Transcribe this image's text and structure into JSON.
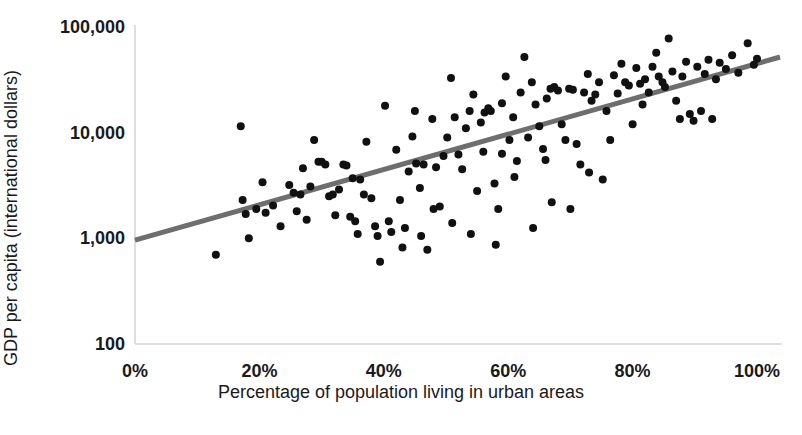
{
  "chart_data": {
    "type": "scatter",
    "title": "",
    "xlabel": "Percentage of population living in urban areas",
    "ylabel": "GDP per capita (international dollars)",
    "xlim": [
      0,
      100
    ],
    "ylim": [
      100,
      100000
    ],
    "yscale": "log",
    "xscale": "linear",
    "grid": false,
    "legend": "none",
    "xticklabels": [
      "0%",
      "20%",
      "40%",
      "60%",
      "80%",
      "100%"
    ],
    "xticks": [
      0,
      20,
      40,
      60,
      80,
      100
    ],
    "yticklabels": [
      "100",
      "1,000",
      "10,000",
      "100,000"
    ],
    "yticks": [
      100,
      1000,
      10000,
      100000
    ],
    "marker_color": "#111111",
    "marker_size_px": 8,
    "trendline": {
      "color": "#6e6e6e",
      "width_px": 5,
      "x_start": 0,
      "y_start": 960,
      "x_end": 103.7,
      "y_end": 52000
    },
    "axis_color": "#d4d4d4",
    "points": [
      {
        "x": 13.0,
        "y": 700
      },
      {
        "x": 17.0,
        "y": 11500
      },
      {
        "x": 17.3,
        "y": 2300
      },
      {
        "x": 17.8,
        "y": 1700
      },
      {
        "x": 18.3,
        "y": 1000
      },
      {
        "x": 19.5,
        "y": 1900
      },
      {
        "x": 21.0,
        "y": 1750
      },
      {
        "x": 22.2,
        "y": 2050
      },
      {
        "x": 23.4,
        "y": 1300
      },
      {
        "x": 24.8,
        "y": 3200
      },
      {
        "x": 25.5,
        "y": 2700
      },
      {
        "x": 26.0,
        "y": 1800
      },
      {
        "x": 26.6,
        "y": 2600
      },
      {
        "x": 27.0,
        "y": 4600
      },
      {
        "x": 27.6,
        "y": 1500
      },
      {
        "x": 28.2,
        "y": 3100
      },
      {
        "x": 28.8,
        "y": 8500
      },
      {
        "x": 29.5,
        "y": 5300
      },
      {
        "x": 30.0,
        "y": 5300
      },
      {
        "x": 30.6,
        "y": 5000
      },
      {
        "x": 31.2,
        "y": 2500
      },
      {
        "x": 31.8,
        "y": 2600
      },
      {
        "x": 32.2,
        "y": 1650
      },
      {
        "x": 32.8,
        "y": 2900
      },
      {
        "x": 33.5,
        "y": 5000
      },
      {
        "x": 34.0,
        "y": 4900
      },
      {
        "x": 34.6,
        "y": 1600
      },
      {
        "x": 35.0,
        "y": 3700
      },
      {
        "x": 35.4,
        "y": 1450
      },
      {
        "x": 35.8,
        "y": 1100
      },
      {
        "x": 36.2,
        "y": 3600
      },
      {
        "x": 36.8,
        "y": 2600
      },
      {
        "x": 37.2,
        "y": 8200
      },
      {
        "x": 38.0,
        "y": 2400
      },
      {
        "x": 38.6,
        "y": 1300
      },
      {
        "x": 39.4,
        "y": 600
      },
      {
        "x": 40.2,
        "y": 18000
      },
      {
        "x": 40.8,
        "y": 1450
      },
      {
        "x": 41.2,
        "y": 1150
      },
      {
        "x": 42.0,
        "y": 6900
      },
      {
        "x": 42.6,
        "y": 2300
      },
      {
        "x": 43.4,
        "y": 1250
      },
      {
        "x": 44.0,
        "y": 4300
      },
      {
        "x": 44.6,
        "y": 9200
      },
      {
        "x": 45.2,
        "y": 5100
      },
      {
        "x": 45.8,
        "y": 3000
      },
      {
        "x": 46.4,
        "y": 5000
      },
      {
        "x": 47.0,
        "y": 780
      },
      {
        "x": 47.8,
        "y": 13500
      },
      {
        "x": 48.4,
        "y": 4700
      },
      {
        "x": 49.0,
        "y": 2000
      },
      {
        "x": 49.6,
        "y": 6000
      },
      {
        "x": 50.2,
        "y": 9000
      },
      {
        "x": 50.8,
        "y": 33000
      },
      {
        "x": 51.4,
        "y": 14000
      },
      {
        "x": 52.0,
        "y": 6200
      },
      {
        "x": 52.6,
        "y": 4500
      },
      {
        "x": 53.2,
        "y": 11000
      },
      {
        "x": 53.8,
        "y": 16000
      },
      {
        "x": 54.4,
        "y": 23000
      },
      {
        "x": 55.0,
        "y": 2800
      },
      {
        "x": 55.6,
        "y": 12500
      },
      {
        "x": 56.2,
        "y": 15500
      },
      {
        "x": 56.8,
        "y": 17000
      },
      {
        "x": 57.2,
        "y": 16000
      },
      {
        "x": 57.8,
        "y": 3300
      },
      {
        "x": 58.4,
        "y": 1900
      },
      {
        "x": 59.0,
        "y": 19000
      },
      {
        "x": 59.6,
        "y": 34000
      },
      {
        "x": 60.2,
        "y": 8500
      },
      {
        "x": 60.8,
        "y": 14000
      },
      {
        "x": 61.4,
        "y": 5400
      },
      {
        "x": 62.0,
        "y": 24000
      },
      {
        "x": 62.6,
        "y": 52000
      },
      {
        "x": 63.2,
        "y": 9000
      },
      {
        "x": 63.8,
        "y": 30000
      },
      {
        "x": 64.4,
        "y": 18500
      },
      {
        "x": 65.0,
        "y": 11500
      },
      {
        "x": 65.6,
        "y": 7000
      },
      {
        "x": 66.2,
        "y": 21000
      },
      {
        "x": 66.8,
        "y": 26000
      },
      {
        "x": 67.4,
        "y": 27000
      },
      {
        "x": 68.0,
        "y": 25000
      },
      {
        "x": 68.6,
        "y": 12000
      },
      {
        "x": 69.2,
        "y": 8500
      },
      {
        "x": 69.8,
        "y": 26000
      },
      {
        "x": 70.4,
        "y": 25500
      },
      {
        "x": 71.0,
        "y": 7800
      },
      {
        "x": 71.6,
        "y": 5000
      },
      {
        "x": 72.2,
        "y": 24000
      },
      {
        "x": 72.8,
        "y": 36000
      },
      {
        "x": 73.4,
        "y": 20000
      },
      {
        "x": 74.0,
        "y": 23000
      },
      {
        "x": 74.6,
        "y": 30000
      },
      {
        "x": 75.2,
        "y": 3600
      },
      {
        "x": 75.8,
        "y": 16000
      },
      {
        "x": 76.4,
        "y": 8500
      },
      {
        "x": 77.0,
        "y": 35000
      },
      {
        "x": 77.6,
        "y": 23500
      },
      {
        "x": 78.2,
        "y": 45000
      },
      {
        "x": 78.8,
        "y": 30000
      },
      {
        "x": 79.4,
        "y": 28000
      },
      {
        "x": 80.0,
        "y": 12000
      },
      {
        "x": 80.6,
        "y": 41000
      },
      {
        "x": 81.2,
        "y": 29000
      },
      {
        "x": 81.6,
        "y": 18500
      },
      {
        "x": 82.0,
        "y": 32000
      },
      {
        "x": 82.6,
        "y": 24000
      },
      {
        "x": 83.2,
        "y": 42000
      },
      {
        "x": 83.8,
        "y": 57000
      },
      {
        "x": 84.2,
        "y": 34000
      },
      {
        "x": 84.8,
        "y": 30000
      },
      {
        "x": 85.2,
        "y": 27000
      },
      {
        "x": 85.8,
        "y": 78000
      },
      {
        "x": 86.4,
        "y": 38000
      },
      {
        "x": 87.0,
        "y": 20000
      },
      {
        "x": 87.6,
        "y": 13500
      },
      {
        "x": 88.0,
        "y": 34000
      },
      {
        "x": 88.6,
        "y": 47000
      },
      {
        "x": 89.2,
        "y": 15000
      },
      {
        "x": 89.8,
        "y": 13000
      },
      {
        "x": 90.4,
        "y": 42000
      },
      {
        "x": 91.0,
        "y": 16000
      },
      {
        "x": 91.6,
        "y": 36000
      },
      {
        "x": 92.2,
        "y": 49000
      },
      {
        "x": 92.8,
        "y": 13500
      },
      {
        "x": 93.4,
        "y": 32000
      },
      {
        "x": 94.0,
        "y": 46000
      },
      {
        "x": 95.0,
        "y": 40000
      },
      {
        "x": 96.0,
        "y": 54000
      },
      {
        "x": 97.0,
        "y": 37000
      },
      {
        "x": 98.5,
        "y": 70000
      },
      {
        "x": 99.5,
        "y": 44000
      },
      {
        "x": 100.0,
        "y": 50000
      },
      {
        "x": 43.0,
        "y": 820
      },
      {
        "x": 46.0,
        "y": 1050
      },
      {
        "x": 54.0,
        "y": 1100
      },
      {
        "x": 58.0,
        "y": 870
      },
      {
        "x": 64.0,
        "y": 1250
      },
      {
        "x": 67.0,
        "y": 2200
      },
      {
        "x": 70.0,
        "y": 1900
      },
      {
        "x": 73.0,
        "y": 4200
      },
      {
        "x": 51.0,
        "y": 1400
      },
      {
        "x": 48.0,
        "y": 1900
      },
      {
        "x": 39.0,
        "y": 1050
      },
      {
        "x": 61.0,
        "y": 3800
      },
      {
        "x": 66.0,
        "y": 5500
      },
      {
        "x": 59.0,
        "y": 6300
      },
      {
        "x": 56.0,
        "y": 6600
      },
      {
        "x": 45.0,
        "y": 16000
      },
      {
        "x": 20.5,
        "y": 3400
      }
    ]
  }
}
